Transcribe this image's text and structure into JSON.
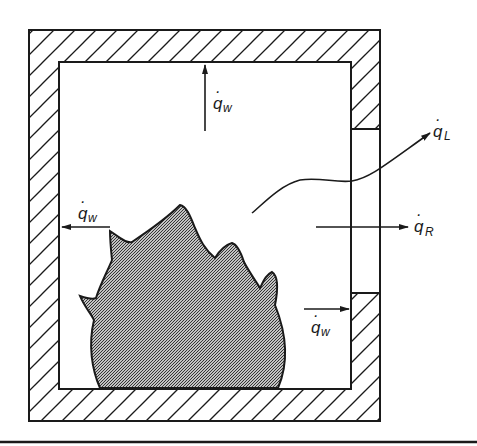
{
  "diagram": {
    "type": "compartment-fire-energy-balance",
    "enclosure": {
      "walls": "hatched",
      "opening": "right wall window"
    },
    "flame": {
      "fill": "dense diagonal hatch",
      "position": "floor, center-left"
    },
    "labels": {
      "q_w_top": {
        "base": "q",
        "dot": "·",
        "subscript": "w"
      },
      "q_w_left": {
        "base": "q",
        "dot": "·",
        "subscript": "w"
      },
      "q_w_right": {
        "base": "q",
        "dot": "·",
        "subscript": "w"
      },
      "q_L": {
        "base": "q",
        "dot": "·",
        "subscript": "L"
      },
      "q_R": {
        "base": "q",
        "dot": "·",
        "subscript": "R"
      }
    },
    "colors": {
      "line": "#1a1a1a",
      "background": "#ffffff",
      "flame_fill": "#555555"
    }
  }
}
